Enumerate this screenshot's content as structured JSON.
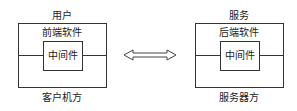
{
  "client": {
    "top_label": "用户",
    "software_label": "前端软件",
    "middleware_label": "中间件",
    "bottom_label": "客户机方"
  },
  "server": {
    "top_label": "服务",
    "software_label": "后端软件",
    "middleware_label": "中间件",
    "bottom_label": "服务器方"
  },
  "connector": {
    "icon": "double-arrow-icon"
  }
}
